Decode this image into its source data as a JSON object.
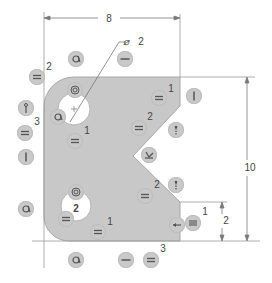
{
  "diagram": {
    "type": "cad-sketch-constraints",
    "colors": {
      "part_fill": "#c8c8c8",
      "line": "#8a8a8a",
      "dimension_line": "#7a7a7a",
      "glyph_bg": "#c9c9c9",
      "glyph_stroke": "#555555",
      "text": "#444444"
    },
    "dimensions": {
      "width": "8",
      "height": "10",
      "notch_offset": "2",
      "hole_diameter_symbol": "⌀",
      "hole_diameter": "2"
    },
    "labels": [
      {
        "id": "top-left-2",
        "text": "2",
        "x": 49,
        "y": 67
      },
      {
        "id": "left-3",
        "text": "3",
        "x": 37,
        "y": 122
      },
      {
        "id": "top-hole-1",
        "text": "1",
        "x": 87,
        "y": 131
      },
      {
        "id": "right-upper-1",
        "text": "1",
        "x": 171,
        "y": 89
      },
      {
        "id": "notch-upper-2",
        "text": "2",
        "x": 150,
        "y": 117
      },
      {
        "id": "notch-lower-2",
        "text": "2",
        "x": 157,
        "y": 185
      },
      {
        "id": "bottom-hole-2",
        "text": "2",
        "x": 76,
        "y": 209
      },
      {
        "id": "bottom-1",
        "text": "1",
        "x": 110,
        "y": 222
      },
      {
        "id": "bottom-3",
        "text": "3",
        "x": 163,
        "y": 249
      },
      {
        "id": "right-1",
        "text": "1",
        "x": 205,
        "y": 212
      }
    ],
    "constraint_glyphs": [
      {
        "id": "equal-top-left",
        "kind": "equal",
        "x": 37,
        "y": 77
      },
      {
        "id": "tangent-top",
        "kind": "tangent",
        "x": 76,
        "y": 59
      },
      {
        "id": "horizontal-top",
        "kind": "horizontal",
        "x": 125,
        "y": 59
      },
      {
        "id": "concentric-top-hole",
        "kind": "concentric",
        "x": 75,
        "y": 90
      },
      {
        "id": "tangent-top-hole",
        "kind": "tangent",
        "x": 58,
        "y": 117
      },
      {
        "id": "coincident-left",
        "kind": "coincident",
        "x": 26,
        "y": 108
      },
      {
        "id": "equal-left",
        "kind": "equal",
        "x": 25,
        "y": 133
      },
      {
        "id": "vertical-left",
        "kind": "vertical",
        "x": 26,
        "y": 157
      },
      {
        "id": "equal-under-top-hole",
        "kind": "equal",
        "x": 75,
        "y": 141
      },
      {
        "id": "equal-upper-right",
        "kind": "equal",
        "x": 159,
        "y": 98
      },
      {
        "id": "vertical-right",
        "kind": "vertical",
        "x": 194,
        "y": 96
      },
      {
        "id": "equal-mid",
        "kind": "equal",
        "x": 139,
        "y": 128
      },
      {
        "id": "coincident-notch",
        "kind": "coincident",
        "x": 176,
        "y": 130
      },
      {
        "id": "perpendicular-notch",
        "kind": "perpendicular",
        "x": 149,
        "y": 155
      },
      {
        "id": "coincident-lower-notch",
        "kind": "coincident",
        "x": 176,
        "y": 185
      },
      {
        "id": "equal-lower-notch",
        "kind": "equal",
        "x": 145,
        "y": 196
      },
      {
        "id": "tangent-left-lower",
        "kind": "tangent",
        "x": 26,
        "y": 209
      },
      {
        "id": "concentric-bottom-hole",
        "kind": "concentric",
        "x": 76,
        "y": 192
      },
      {
        "id": "equal-bottom-hole",
        "kind": "equal",
        "x": 66,
        "y": 219
      },
      {
        "id": "equal-bottom",
        "kind": "equal",
        "x": 98,
        "y": 232
      },
      {
        "id": "midpoint-right",
        "kind": "midpoint",
        "x": 177,
        "y": 225
      },
      {
        "id": "equal-right",
        "kind": "equal",
        "x": 193,
        "y": 223
      },
      {
        "id": "tangent-bottom",
        "kind": "tangent",
        "x": 76,
        "y": 260
      },
      {
        "id": "horizontal-bottom",
        "kind": "horizontal",
        "x": 126,
        "y": 260
      },
      {
        "id": "equal-bottom-right",
        "kind": "equal",
        "x": 151,
        "y": 260
      }
    ]
  }
}
